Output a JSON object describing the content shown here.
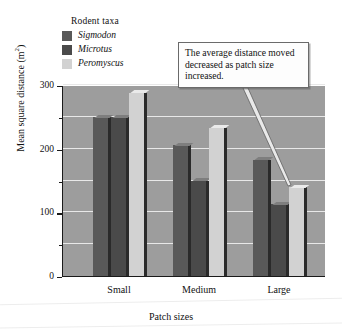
{
  "legend": {
    "title": "Rodent taxa",
    "items": [
      {
        "label": "Sigmodon",
        "color": "#595959"
      },
      {
        "label": "Microtus",
        "color": "#4a4a4a"
      },
      {
        "label": "Peromyscus",
        "color": "#d2d2d2"
      }
    ]
  },
  "callout": {
    "text": "The average distance moved decreased as patch size increased."
  },
  "axes": {
    "ylabel_main": "Mean square distance (m",
    "ylabel_sup": "2",
    "ylabel_close": ")",
    "xlabel": "Patch sizes",
    "yticks": [
      "0",
      "100",
      "200",
      "300"
    ]
  },
  "chart_data": {
    "type": "bar",
    "title": "",
    "xlabel": "Patch sizes",
    "ylabel": "Mean square distance (m2)",
    "categories": [
      "Small",
      "Medium",
      "Large"
    ],
    "ylim": [
      0,
      300
    ],
    "ytick_values": [
      0,
      100,
      200,
      300
    ],
    "gridlines": [
      50,
      100,
      150,
      200,
      250,
      300
    ],
    "grid": true,
    "legend_position": "above-left",
    "series": [
      {
        "name": "Sigmodon",
        "color": "#595959",
        "values": [
          250,
          205,
          183
        ]
      },
      {
        "name": "Microtus",
        "color": "#4a4a4a",
        "values": [
          250,
          150,
          113
        ]
      },
      {
        "name": "Peromyscus",
        "color": "#d2d2d2",
        "values": [
          288,
          233,
          140
        ]
      }
    ],
    "annotations": [
      {
        "text": "The average distance moved decreased as patch size increased.",
        "points_to": "Large"
      }
    ]
  }
}
